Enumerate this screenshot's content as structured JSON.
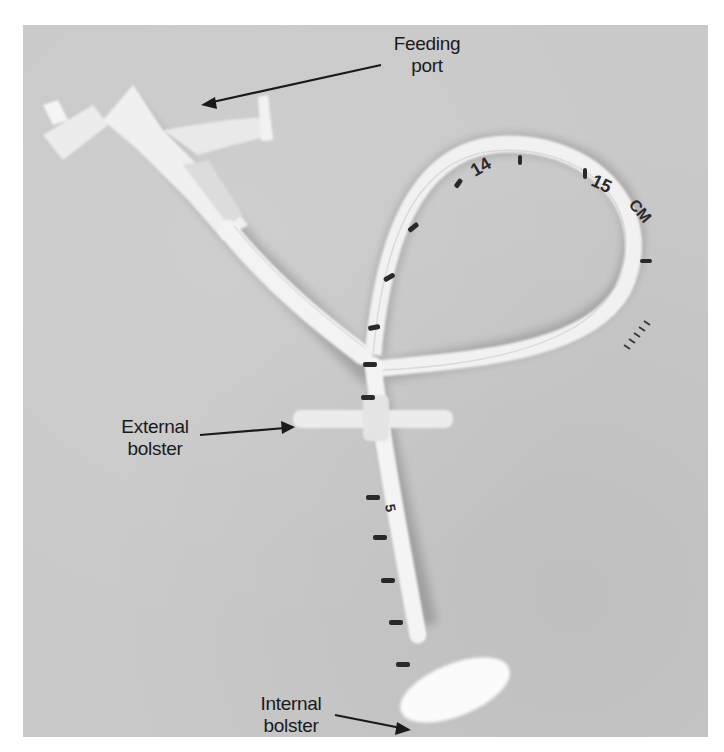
{
  "figure": {
    "labels": [
      {
        "id": "feeding-port",
        "line1": "Feeding",
        "line2": "port"
      },
      {
        "id": "external-bolster",
        "line1": "External",
        "line2": "bolster"
      },
      {
        "id": "internal-bolster",
        "line1": "Internal",
        "line2": "bolster"
      }
    ],
    "tube_markings": [
      "14",
      "15",
      "CM",
      "5"
    ],
    "colors": {
      "background": "#c9c9c9",
      "tube": "#f2f2f2",
      "marking": "#2a2a2a",
      "text": "#1a1a1a",
      "page": "#ffffff"
    }
  }
}
